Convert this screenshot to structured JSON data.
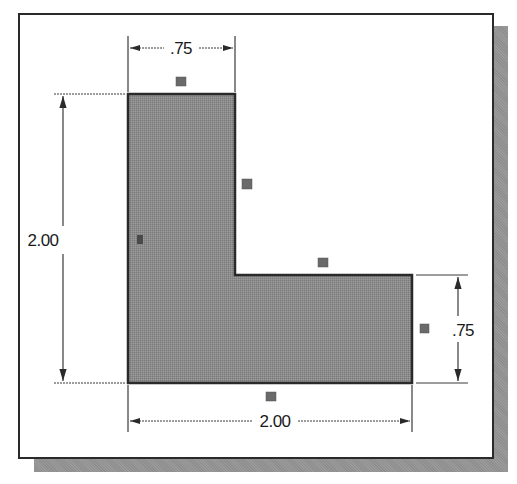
{
  "figure": {
    "shape": "L-shaped profile",
    "colors": {
      "fill": "#8c8c8c",
      "outline": "#2a2a2a",
      "dimension_line": "#3a3a3a",
      "marker": "#6a6a6a",
      "shadow": "#9a9a9a",
      "background": "#ffffff"
    },
    "dimensions": {
      "top_width": ".75",
      "left_height": "2.00",
      "right_height": ".75",
      "bottom_width": "2.00"
    },
    "markers": [
      {
        "name": "top-edge-marker",
        "x": 176,
        "y": 77
      },
      {
        "name": "inner-vertical-edge-marker",
        "x": 242,
        "y": 179
      },
      {
        "name": "left-edge-marker",
        "x": 137,
        "y": 235
      },
      {
        "name": "inner-horizontal-edge-marker",
        "x": 318,
        "y": 258
      },
      {
        "name": "right-edge-marker",
        "x": 420,
        "y": 324
      },
      {
        "name": "bottom-edge-marker",
        "x": 266,
        "y": 392
      }
    ]
  }
}
